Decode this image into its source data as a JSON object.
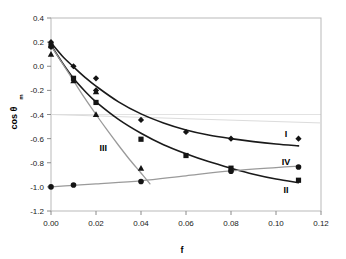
{
  "chart_data": {
    "type": "scatter",
    "title": "",
    "xlabel": "f",
    "ylabel": "cos θ",
    "ylabel_sub": "m",
    "xlim": [
      0.0,
      0.12
    ],
    "ylim": [
      -1.2,
      0.4
    ],
    "xticks": [
      0.0,
      0.02,
      0.04,
      0.06,
      0.08,
      0.1,
      0.12
    ],
    "xtick_labels": [
      "0.00",
      "0.02",
      "0.04",
      "0.06",
      "0.08",
      "0.10",
      "0.12"
    ],
    "yticks": [
      0.4,
      0.2,
      0.0,
      -0.2,
      -0.4,
      -0.6,
      -0.8,
      -1.0,
      -1.2
    ],
    "ytick_labels": [
      "0.4",
      "0.2",
      "0.0",
      "-0.2",
      "-0.4",
      "-0.6",
      "-0.8",
      "-1.0",
      "-1.2"
    ],
    "grid": false,
    "legend_position": "inline-right-annotations",
    "series": [
      {
        "name": "I",
        "marker": "diamond",
        "label": "I",
        "label_x": 0.1045,
        "label_y": -0.565,
        "color": "#141414",
        "line_color": "#1a1a1a",
        "x": [
          0.0,
          0.0,
          0.01,
          0.02,
          0.02,
          0.04,
          0.06,
          0.08,
          0.11
        ],
        "y": [
          0.2,
          0.16,
          0.0,
          -0.1,
          -0.2,
          -0.445,
          -0.545,
          -0.6,
          -0.6
        ],
        "fit_x": [
          0.0,
          0.005,
          0.01,
          0.015,
          0.02,
          0.03,
          0.04,
          0.05,
          0.06,
          0.07,
          0.08,
          0.09,
          0.1,
          0.11
        ],
        "fit_y": [
          0.195,
          0.085,
          -0.005,
          -0.09,
          -0.165,
          -0.295,
          -0.395,
          -0.47,
          -0.528,
          -0.57,
          -0.6,
          -0.625,
          -0.645,
          -0.66
        ]
      },
      {
        "name": "II",
        "marker": "square",
        "label": "II",
        "label_x": 0.1045,
        "label_y": -1.03,
        "color": "#141414",
        "line_color": "#1a1a1a",
        "x": [
          0.0,
          0.01,
          0.02,
          0.04,
          0.06,
          0.08,
          0.11
        ],
        "y": [
          0.17,
          -0.1,
          -0.3,
          -0.605,
          -0.74,
          -0.845,
          -0.945
        ],
        "fit_x": [
          0.0,
          0.005,
          0.01,
          0.015,
          0.02,
          0.03,
          0.04,
          0.05,
          0.06,
          0.07,
          0.08,
          0.09,
          0.1,
          0.11
        ],
        "fit_y": [
          0.175,
          0.03,
          -0.1,
          -0.205,
          -0.295,
          -0.44,
          -0.555,
          -0.65,
          -0.725,
          -0.79,
          -0.845,
          -0.895,
          -0.935,
          -0.965
        ]
      },
      {
        "name": "III",
        "marker": "triangle",
        "label": "III",
        "label_x": 0.0232,
        "label_y": -0.68,
        "color": "#141414",
        "line_color": "#9a9a9a",
        "x": [
          0.0,
          0.01,
          0.02,
          0.02,
          0.04
        ],
        "y": [
          0.1,
          -0.12,
          -0.21,
          -0.4,
          -0.845
        ],
        "fit_x": [
          0.0,
          0.005,
          0.01,
          0.015,
          0.02,
          0.025,
          0.03,
          0.035,
          0.04,
          0.044
        ],
        "fit_y": [
          0.17,
          0.025,
          -0.12,
          -0.265,
          -0.4,
          -0.53,
          -0.655,
          -0.775,
          -0.885,
          -0.975
        ]
      },
      {
        "name": "IV",
        "marker": "circle",
        "label": "IV",
        "label_x": 0.1045,
        "label_y": -0.79,
        "color": "#141414",
        "line_color": "#9a9a9a",
        "x": [
          0.0,
          0.01,
          0.04,
          0.08,
          0.11
        ],
        "y": [
          -1.0,
          -0.985,
          -0.955,
          -0.87,
          -0.835
        ],
        "fit_x": [
          0.0,
          0.01,
          0.02,
          0.04,
          0.06,
          0.08,
          0.1,
          0.11
        ],
        "fit_y": [
          -1.0,
          -0.988,
          -0.975,
          -0.95,
          -0.908,
          -0.868,
          -0.84,
          -0.828
        ]
      }
    ],
    "reference_line": {
      "name": "upper-gray-reference",
      "x": [
        0.0,
        0.12
      ],
      "y": [
        -0.4,
        -0.47
      ],
      "color": "#dcdcdc"
    }
  }
}
